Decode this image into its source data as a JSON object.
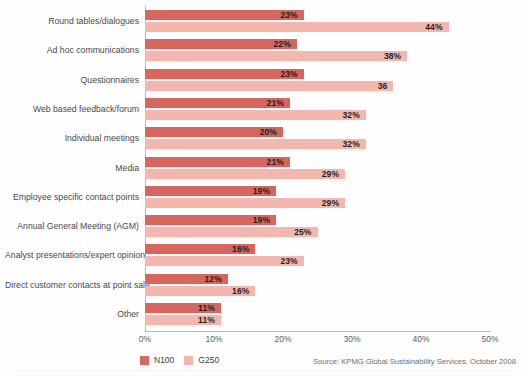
{
  "chart_data": {
    "type": "bar",
    "orientation": "horizontal",
    "title": "",
    "xlabel": "",
    "ylabel": "",
    "xlim": [
      0,
      50
    ],
    "xticks": [
      "0%",
      "10%",
      "20%",
      "30%",
      "40%",
      "50%"
    ],
    "xtick_values": [
      0,
      10,
      20,
      30,
      40,
      50
    ],
    "grid": false,
    "legend_position": "bottom-left",
    "categories": [
      "Round tables/dialogues",
      "Ad hoc communications",
      "Questionnaires",
      "Web based feedback/forum",
      "Individual meetings",
      "Media",
      "Employee specific contact points",
      "Annual General Meeting (AGM)",
      "Analyst presentations/expert opinion",
      "Direct customer contacts at point sale",
      "Other"
    ],
    "series": [
      {
        "name": "N100",
        "color": "#d9655c",
        "values": [
          23,
          22,
          23,
          21,
          20,
          21,
          19,
          19,
          16,
          12,
          11
        ],
        "labels": [
          "23%",
          "22%",
          "23%",
          "21%",
          "20%",
          "21%",
          "19%",
          "19%",
          "16%",
          "12%",
          "11%"
        ]
      },
      {
        "name": "G250",
        "color": "#f3b7ad",
        "values": [
          44,
          38,
          36,
          32,
          32,
          29,
          29,
          25,
          23,
          16,
          11
        ],
        "labels": [
          "44%",
          "38%",
          "36",
          "32%",
          "32%",
          "29%",
          "29%",
          "25%",
          "23%",
          "16%",
          "11%"
        ]
      }
    ]
  },
  "legend": [
    {
      "label": "N100",
      "color": "#d9655c"
    },
    {
      "label": "G250",
      "color": "#f3b7ad"
    }
  ],
  "source": {
    "text": "Source: KPMG Global Sustainability Services, October 2008"
  },
  "colors": {
    "n100": "#d9655c",
    "g250": "#f3b7ad",
    "axis": "#b9b9b9",
    "label_text": "#4a4a4a",
    "value_text": "#231f20"
  }
}
